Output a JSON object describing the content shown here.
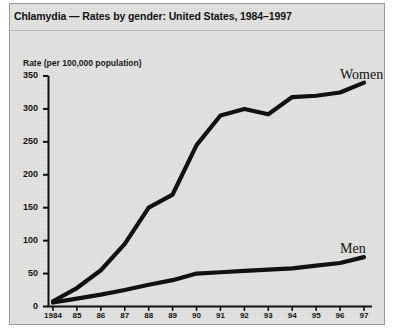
{
  "figure": {
    "title": "Chlamydia — Rates by gender: United States, 1984–1997",
    "background_color": "#d8d8d6",
    "line_color": "#111111",
    "border_color": "#9a9a98"
  },
  "axes": {
    "ylabel": "Rate (per 100,000 population)",
    "xlabel": "",
    "ytick_labels": [
      "0",
      "50",
      "100",
      "150",
      "200",
      "250",
      "300",
      "350"
    ],
    "xtick_labels": [
      "1984",
      "85",
      "86",
      "87",
      "88",
      "89",
      "90",
      "91",
      "92",
      "93",
      "94",
      "95",
      "96",
      "97"
    ]
  },
  "series_labels": {
    "women": "Women",
    "men": "Men"
  },
  "chart_data": {
    "type": "line",
    "title": "Chlamydia — Rates by gender: United States, 1984–1997",
    "xlabel": "",
    "ylabel": "Rate (per 100,000 population)",
    "x": [
      "1984",
      "1985",
      "1986",
      "1987",
      "1988",
      "1989",
      "1990",
      "1991",
      "1992",
      "1993",
      "1994",
      "1995",
      "1996",
      "1997"
    ],
    "xtick_labels": [
      "1984",
      "85",
      "86",
      "87",
      "88",
      "89",
      "90",
      "91",
      "92",
      "93",
      "94",
      "95",
      "96",
      "97"
    ],
    "xlim": [
      1984,
      1997
    ],
    "ylim": [
      0,
      350
    ],
    "yticks": [
      0,
      50,
      100,
      150,
      200,
      250,
      300,
      350
    ],
    "grid": false,
    "legend": "inline-right-labels",
    "series": [
      {
        "name": "Women",
        "values": [
          8,
          28,
          55,
          95,
          150,
          170,
          245,
          290,
          300,
          292,
          318,
          320,
          325,
          340
        ]
      },
      {
        "name": "Men",
        "values": [
          6,
          12,
          18,
          25,
          33,
          40,
          50,
          52,
          54,
          56,
          58,
          62,
          66,
          75
        ]
      }
    ]
  }
}
